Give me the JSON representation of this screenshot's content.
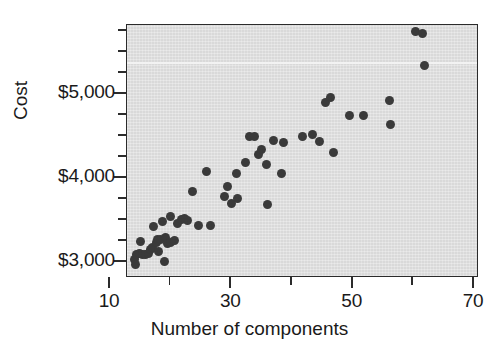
{
  "chart_data": {
    "type": "scatter",
    "title": "",
    "xlabel": "Number of components",
    "ylabel": "Cost",
    "xlim": [
      13,
      72
    ],
    "ylim": [
      2800,
      5820
    ],
    "grid": false,
    "legend": null,
    "x_ticks_major": [
      10,
      30,
      50,
      70
    ],
    "x_tick_labels": [
      "10",
      "30",
      "50",
      "70"
    ],
    "x_ticks_minor": [
      20,
      40,
      60
    ],
    "y_ticks_major": [
      3000,
      4000,
      5000
    ],
    "y_tick_labels": [
      "$3,000",
      "$4,000",
      "$5,000"
    ],
    "y_ticks_minor": [
      2750,
      3250,
      3500,
      3750,
      4250,
      4500,
      4750,
      5250,
      5500,
      5750
    ],
    "marker_color": "#3a3a3a",
    "plot_background": "#d9d9d9",
    "axis_color": "#2b2b2b",
    "n_points": 60,
    "points": [
      {
        "x": 14.0,
        "y": 3030
      },
      {
        "x": 14.2,
        "y": 2970
      },
      {
        "x": 14.3,
        "y": 3090
      },
      {
        "x": 14.8,
        "y": 3100
      },
      {
        "x": 15.0,
        "y": 3250
      },
      {
        "x": 15.4,
        "y": 3095
      },
      {
        "x": 15.9,
        "y": 3090
      },
      {
        "x": 16.3,
        "y": 3105
      },
      {
        "x": 16.7,
        "y": 3150
      },
      {
        "x": 17.0,
        "y": 3170
      },
      {
        "x": 17.1,
        "y": 3420
      },
      {
        "x": 17.6,
        "y": 3230
      },
      {
        "x": 17.9,
        "y": 3265
      },
      {
        "x": 18.0,
        "y": 3120
      },
      {
        "x": 18.4,
        "y": 3270
      },
      {
        "x": 18.6,
        "y": 3480
      },
      {
        "x": 19.0,
        "y": 3010
      },
      {
        "x": 19.2,
        "y": 3290
      },
      {
        "x": 19.4,
        "y": 3225
      },
      {
        "x": 19.9,
        "y": 3540
      },
      {
        "x": 20.0,
        "y": 3230
      },
      {
        "x": 20.6,
        "y": 3260
      },
      {
        "x": 21.2,
        "y": 3455
      },
      {
        "x": 21.8,
        "y": 3510
      },
      {
        "x": 22.2,
        "y": 3520
      },
      {
        "x": 22.8,
        "y": 3500
      },
      {
        "x": 23.6,
        "y": 3840
      },
      {
        "x": 24.6,
        "y": 3440
      },
      {
        "x": 25.9,
        "y": 4080
      },
      {
        "x": 26.6,
        "y": 3440
      },
      {
        "x": 28.8,
        "y": 3775
      },
      {
        "x": 29.4,
        "y": 3900
      },
      {
        "x": 30.1,
        "y": 3700
      },
      {
        "x": 30.8,
        "y": 4050
      },
      {
        "x": 31.0,
        "y": 3760
      },
      {
        "x": 32.4,
        "y": 4190
      },
      {
        "x": 33.0,
        "y": 4500
      },
      {
        "x": 33.9,
        "y": 4500
      },
      {
        "x": 34.5,
        "y": 4280
      },
      {
        "x": 35.0,
        "y": 4340
      },
      {
        "x": 35.8,
        "y": 4160
      },
      {
        "x": 36.0,
        "y": 3680
      },
      {
        "x": 36.9,
        "y": 4450
      },
      {
        "x": 38.2,
        "y": 4050
      },
      {
        "x": 38.6,
        "y": 4420
      },
      {
        "x": 41.8,
        "y": 4500
      },
      {
        "x": 43.4,
        "y": 4520
      },
      {
        "x": 44.6,
        "y": 4440
      },
      {
        "x": 45.5,
        "y": 4900
      },
      {
        "x": 46.3,
        "y": 4960
      },
      {
        "x": 46.9,
        "y": 4300
      },
      {
        "x": 49.4,
        "y": 4740
      },
      {
        "x": 51.8,
        "y": 4740
      },
      {
        "x": 56.1,
        "y": 4920
      },
      {
        "x": 56.3,
        "y": 4640
      },
      {
        "x": 60.3,
        "y": 5740
      },
      {
        "x": 61.5,
        "y": 5720
      },
      {
        "x": 61.8,
        "y": 5340
      }
    ]
  }
}
